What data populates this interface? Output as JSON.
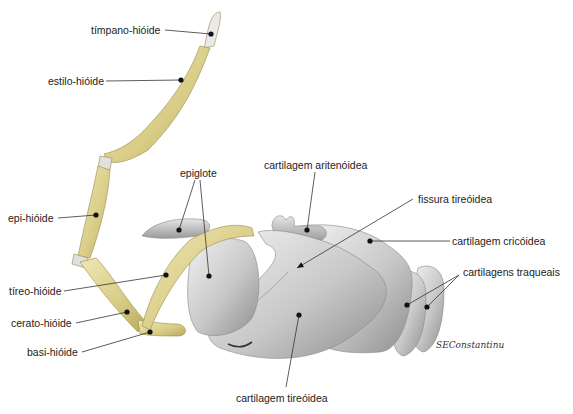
{
  "diagram": {
    "labels": [
      {
        "id": "timpano-hioide",
        "text": "tímpano-hióide",
        "x": 91,
        "y": 24,
        "line": [
          [
            165,
            30
          ],
          [
            211,
            34
          ]
        ]
      },
      {
        "id": "estilo-hioide",
        "text": "estilo-hióide",
        "x": 48,
        "y": 75,
        "line": [
          [
            106,
            81
          ],
          [
            181,
            80
          ]
        ]
      },
      {
        "id": "epi-hioide",
        "text": "epi-hióide",
        "x": 8,
        "y": 212,
        "line": [
          [
            58,
            218
          ],
          [
            96,
            215
          ]
        ]
      },
      {
        "id": "tireo-hioide",
        "text": "tíreo-hióide",
        "x": 9,
        "y": 285,
        "line": [
          [
            64,
            291
          ],
          [
            166,
            275
          ]
        ]
      },
      {
        "id": "cerato-hioide",
        "text": "cerato-hióide",
        "x": 11,
        "y": 317,
        "line": [
          [
            76,
            323
          ],
          [
            127,
            312
          ]
        ]
      },
      {
        "id": "basi-hioide",
        "text": "basi-hióide",
        "x": 27,
        "y": 346,
        "line": [
          [
            82,
            352
          ],
          [
            150,
            332
          ]
        ]
      },
      {
        "id": "epiglote",
        "text": "epiglote",
        "x": 180,
        "y": 167,
        "line": [
          [
            195,
            180
          ],
          [
            179,
            230
          ]
        ],
        "line2": [
          [
            200,
            180
          ],
          [
            209,
            276
          ]
        ]
      },
      {
        "id": "cartilagem-aritenoidea",
        "text": "cartilagem aritenóidea",
        "x": 264,
        "y": 159,
        "line": [
          [
            315,
            172
          ],
          [
            307,
            230
          ]
        ]
      },
      {
        "id": "fissura-tireoidea",
        "text": "fissura tireóidea",
        "x": 418,
        "y": 193,
        "line": [
          [
            413,
            199
          ],
          [
            297,
            268
          ]
        ],
        "arrow": true
      },
      {
        "id": "cartilagem-cricoidea",
        "text": "cartilagem cricóidea",
        "x": 452,
        "y": 235,
        "line": [
          [
            450,
            241
          ],
          [
            370,
            241
          ]
        ]
      },
      {
        "id": "cartilagens-traqueais",
        "text": "cartilagens traqueais",
        "x": 463,
        "y": 266,
        "line": [
          [
            459,
            275
          ],
          [
            407,
            305
          ]
        ],
        "line2": [
          [
            459,
            275
          ],
          [
            427,
            307
          ]
        ]
      },
      {
        "id": "cartilagem-tireoidea",
        "text": "cartilagem tireóidea",
        "x": 236,
        "y": 392,
        "line": [
          [
            286,
            387
          ],
          [
            299,
            315
          ]
        ]
      }
    ],
    "signature": "SEConstantinu"
  },
  "colors": {
    "bone": "#d9cf8f",
    "bone_dark": "#b8a85a",
    "cartilage": "#c9c9c9",
    "cartilage_dark": "#8f8f8f",
    "leader": "#333333"
  }
}
